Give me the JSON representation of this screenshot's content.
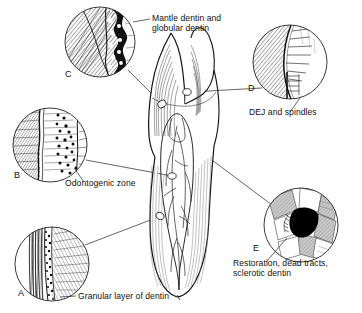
{
  "figure": {
    "background": "#ffffff",
    "ink": "#111111",
    "central_subject": "longitudinal section of a tooth showing enamel, dentin, pulp chamber and root canal"
  },
  "insets": [
    {
      "key": "A",
      "letter": "A",
      "caption": "Granular layer of dentin",
      "cx": 52,
      "cy": 264,
      "r": 37,
      "description": "vertical dense lines at left, dark granular band, diagonal tubule hatching at right"
    },
    {
      "key": "B",
      "letter": "B",
      "caption": "Odontogenic zone",
      "cx": 50,
      "cy": 145,
      "r": 37,
      "description": "hatched dentin at left, predentin band, odontoblast cell bodies as dark dots at right"
    },
    {
      "key": "C",
      "letter": "C",
      "caption": "Mantle dentin and\nglobular dentin",
      "cx": 100,
      "cy": 42,
      "r": 35,
      "description": "diagonal hatched mantle dentin with dark scalloped globular dentin band"
    },
    {
      "key": "D",
      "letter": "D",
      "caption": "DEJ and spindles",
      "cx": 290,
      "cy": 62,
      "r": 37,
      "description": "hatched dentin left of a curved dentinoenamel junction with short enamel spindles at right"
    },
    {
      "key": "E",
      "letter": "E",
      "caption": "Restoration, dead tracts,\nsclerotic dentin",
      "cx": 301,
      "cy": 225,
      "r": 37,
      "description": "blocky grey and white zones with a solid black restoration wedge at center"
    }
  ],
  "colors": {
    "ink": "#111111",
    "hatch": "#444444",
    "grey_fill": "#b9b9b9",
    "dark_fill": "#000000",
    "background": "#ffffff"
  }
}
